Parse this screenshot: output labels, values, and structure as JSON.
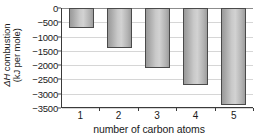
{
  "chart_data": {
    "type": "bar",
    "title": "",
    "categories": [
      "1",
      "2",
      "3",
      "4",
      "5"
    ],
    "values": [
      -700,
      -1400,
      -2100,
      -2700,
      -3380
    ],
    "xlabel": "number of carbon atoms",
    "ylabel_line1": "ΔH combustion",
    "ylabel_line2": "(kJ per mole)",
    "ylabel_delta": "ΔH",
    "ylabel_rest": " combustion",
    "ylim": [
      -3500,
      0
    ],
    "ytick_labels": [
      "0",
      "−500",
      "−1000",
      "−1500",
      "−2000",
      "−2500",
      "−3000",
      "−3500"
    ],
    "ytick_values": [
      0,
      -500,
      -1000,
      -1500,
      -2000,
      -2500,
      -3000,
      -3500
    ],
    "grid": true,
    "legend": "none",
    "orientation": "vertical-negative",
    "colors": {
      "bar_fill_light": "#d2d2d2",
      "bar_fill_dark": "#9a9a9a",
      "bar_border": "#4a4a4a",
      "gridline": "#d6d6d6",
      "axis": "#3a3a3a",
      "background": "#ffffff",
      "text": "#1a1a1a"
    }
  }
}
